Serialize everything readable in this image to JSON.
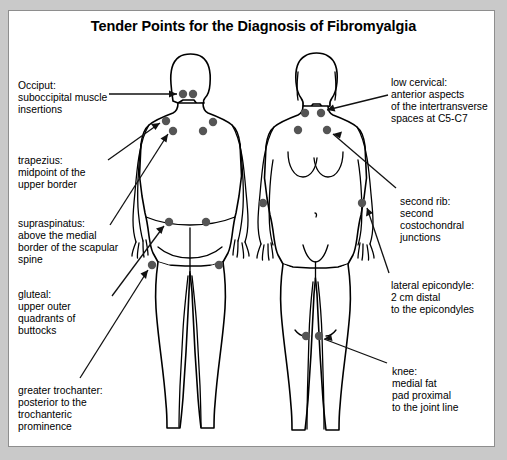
{
  "figure": {
    "title": "Tender Points for the Diagnosis of Fibromyalgia",
    "frame_color": "#8e8e8e",
    "background_color": "#c9c9c9",
    "canvas_color": "#ffffff",
    "dot_color": "#555555",
    "outline_color": "#000000"
  },
  "labels": {
    "left": [
      {
        "name": "occiput",
        "text": "Occiput:\nsuboccipital muscle\ninsertions",
        "x": 18,
        "y": 80
      },
      {
        "name": "trapezius",
        "text": "trapezius:\nmidpoint of the\nupper border",
        "x": 18,
        "y": 155
      },
      {
        "name": "supraspinatus",
        "text": "supraspinatus:\nabove the medial\nborder of the scapular\nspine",
        "x": 18,
        "y": 218
      },
      {
        "name": "gluteal",
        "text": "gluteal:\nupper outer\nquadrants of\nbuttocks",
        "x": 18,
        "y": 289
      },
      {
        "name": "greater-trochanter",
        "text": "greater trochanter:\nposterior to the\ntrochanteric\nprominence",
        "x": 18,
        "y": 385
      }
    ],
    "right": [
      {
        "name": "low-cervical",
        "text": "low cervical:\nanterior aspects\nof the intertransverse\nspaces at C5-C7",
        "x": 391,
        "y": 77
      },
      {
        "name": "second-rib",
        "text": "second rib:\nsecond\ncostochondral\njunctions",
        "x": 400,
        "y": 196
      },
      {
        "name": "lateral-epicondyle",
        "text": "lateral epicondyle:\n2 cm distal\nto the epicondyles",
        "x": 391,
        "y": 280
      },
      {
        "name": "knee",
        "text": "knee:\nmedial fat\npad proximal\nto the joint line",
        "x": 392,
        "y": 366
      }
    ]
  },
  "tender_points": {
    "posterior_view": [
      {
        "name": "occiput-left",
        "cx": 183,
        "cy": 94,
        "r": 4.2
      },
      {
        "name": "occiput-right",
        "cx": 193,
        "cy": 94,
        "r": 4.2
      },
      {
        "name": "trapezius-left",
        "cx": 166,
        "cy": 121,
        "r": 4.2
      },
      {
        "name": "trapezius-right",
        "cx": 213,
        "cy": 122,
        "r": 4.2
      },
      {
        "name": "supraspinatus-left",
        "cx": 173,
        "cy": 131,
        "r": 4.2
      },
      {
        "name": "supraspinatus-right",
        "cx": 203,
        "cy": 131,
        "r": 4.2
      },
      {
        "name": "gluteal-left",
        "cx": 169,
        "cy": 222,
        "r": 4.2
      },
      {
        "name": "gluteal-right",
        "cx": 206,
        "cy": 222,
        "r": 4.2
      },
      {
        "name": "greater-trochanter-left",
        "cx": 152,
        "cy": 265,
        "r": 4.2
      },
      {
        "name": "greater-trochanter-right",
        "cx": 219,
        "cy": 265,
        "r": 4.2
      }
    ],
    "anterior_view": [
      {
        "name": "low-cervical-left",
        "cx": 305,
        "cy": 113,
        "r": 4.2
      },
      {
        "name": "low-cervical-right",
        "cx": 321,
        "cy": 113,
        "r": 4.2
      },
      {
        "name": "second-rib-left",
        "cx": 298,
        "cy": 130,
        "r": 4.2
      },
      {
        "name": "second-rib-right",
        "cx": 327,
        "cy": 130,
        "r": 4.2
      },
      {
        "name": "lateral-epicondyle-left",
        "cx": 263,
        "cy": 203,
        "r": 4.2
      },
      {
        "name": "lateral-epicondyle-right",
        "cx": 362,
        "cy": 203,
        "r": 4.2
      },
      {
        "name": "knee-left",
        "cx": 306,
        "cy": 336,
        "r": 4.2
      },
      {
        "name": "knee-right",
        "cx": 319,
        "cy": 336,
        "r": 4.2
      }
    ]
  }
}
